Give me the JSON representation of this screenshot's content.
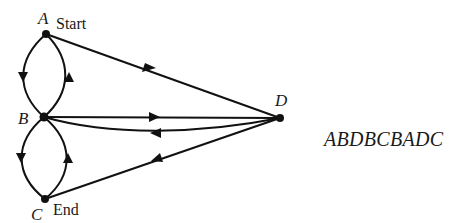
{
  "diagram": {
    "nodes": [
      {
        "id": "A",
        "label": "A",
        "tag": "Start",
        "x": 46,
        "y": 34
      },
      {
        "id": "B",
        "label": "B",
        "tag": "",
        "x": 44,
        "y": 117
      },
      {
        "id": "C",
        "label": "C",
        "tag": "End",
        "x": 45,
        "y": 199
      },
      {
        "id": "D",
        "label": "D",
        "tag": "",
        "x": 280,
        "y": 118
      }
    ],
    "edges": [
      {
        "from": "A",
        "to": "B",
        "side": "left"
      },
      {
        "from": "B",
        "to": "A",
        "side": "right"
      },
      {
        "from": "B",
        "to": "C",
        "side": "left"
      },
      {
        "from": "C",
        "to": "B",
        "side": "right"
      },
      {
        "from": "A",
        "to": "D",
        "shape": "straight"
      },
      {
        "from": "B",
        "to": "D",
        "shape": "straight"
      },
      {
        "from": "D",
        "to": "B",
        "shape": "curved"
      },
      {
        "from": "D",
        "to": "C",
        "shape": "straight"
      }
    ],
    "sequence": "ABDBCBADC"
  }
}
